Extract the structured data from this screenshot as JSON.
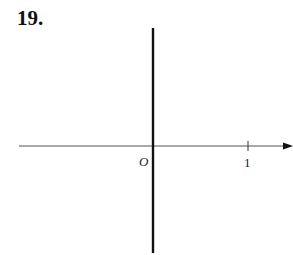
{
  "problem": {
    "number": "19."
  },
  "axes": {
    "origin_label": "O",
    "x_tick_label": "1"
  },
  "colors": {
    "axis": "#333333",
    "y_axis": "#111111"
  }
}
